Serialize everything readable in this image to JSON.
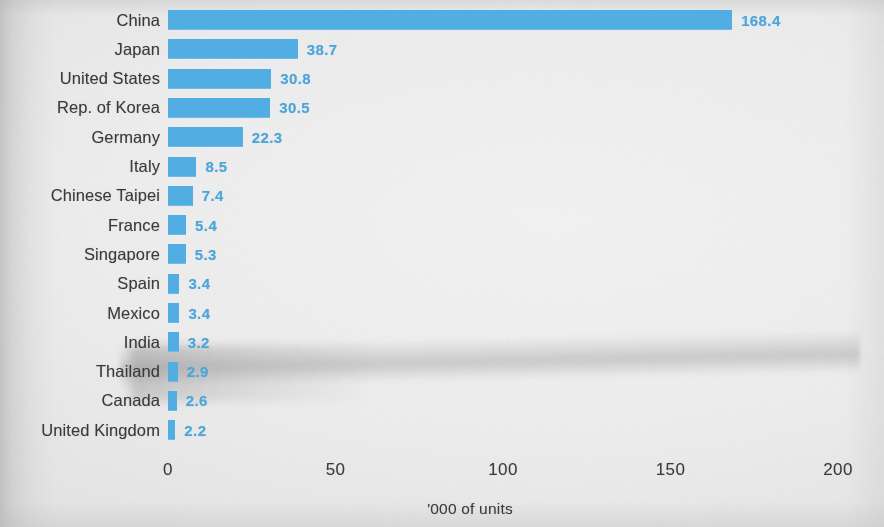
{
  "chart_data": {
    "type": "bar",
    "orientation": "horizontal",
    "title": "",
    "subtitle": "",
    "xlabel": "'000 of units",
    "ylabel": "",
    "xlim": [
      0,
      200
    ],
    "xticks": [
      "0",
      "50",
      "100",
      "150",
      "200"
    ],
    "xtick_values": [
      0,
      50,
      100,
      150,
      200
    ],
    "grid": false,
    "legend": null,
    "categories": [
      "China",
      "Japan",
      "United States",
      "Rep. of Korea",
      "Germany",
      "Italy",
      "Chinese Taipei",
      "France",
      "Singapore",
      "Spain",
      "Mexico",
      "India",
      "Thailand",
      "Canada",
      "United Kingdom"
    ],
    "values": [
      168.4,
      38.7,
      30.8,
      30.5,
      22.3,
      8.5,
      7.4,
      5.4,
      5.3,
      3.4,
      3.4,
      3.2,
      2.9,
      2.6,
      2.2
    ],
    "value_labels": [
      "168.4",
      "38.7",
      "30.8",
      "30.5",
      "22.3",
      "8.5",
      "7.4",
      "5.4",
      "5.3",
      "3.4",
      "3.4",
      "3.2",
      "2.9",
      "2.6",
      "2.2"
    ],
    "bar_color": "#52aee2",
    "value_label_color": "#4ba6dc",
    "category_label_color": "#3a3a3a"
  },
  "axis": {
    "caption": "'000 of units",
    "ticks": [
      {
        "label": "0",
        "value": 0
      },
      {
        "label": "50",
        "value": 50
      },
      {
        "label": "100",
        "value": 100
      },
      {
        "label": "150",
        "value": 150
      },
      {
        "label": "200",
        "value": 200
      }
    ]
  }
}
